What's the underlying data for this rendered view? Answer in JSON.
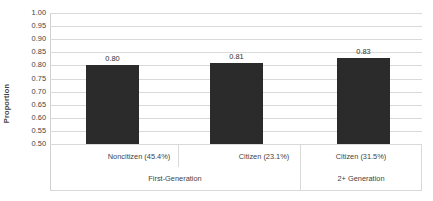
{
  "chart_data": {
    "type": "bar",
    "title": "",
    "xlabel": "",
    "ylabel": "Proportion",
    "ylim": [
      0.5,
      1.0
    ],
    "ystep": 0.05,
    "grid": true,
    "legend": "none",
    "bar_color": "#2b2b2b",
    "gridline_color": "#d9d9d9",
    "text_color": "#3f3f3f",
    "ytick_labels": [
      "1.00",
      "0.95",
      "0.90",
      "0.85",
      "0.80",
      "0.75",
      "0.70",
      "0.65",
      "0.60",
      "0.55",
      "0.50"
    ],
    "categories": [
      "Noncitizen (45.4%)",
      "Citizen (23.1%)",
      "Citizen (31.5%)"
    ],
    "values": [
      0.8,
      0.81,
      0.83
    ],
    "value_labels": [
      "0.80",
      "0.81",
      "0.83"
    ],
    "groups": [
      {
        "label": "First-Generation",
        "categories": [
          "Noncitizen (45.4%)",
          "Citizen (23.1%)"
        ]
      },
      {
        "label": "2+ Generation",
        "categories": [
          "Citizen (31.5%)"
        ]
      }
    ],
    "group_labels": [
      "First-Generation",
      "2+ Generation"
    ]
  }
}
